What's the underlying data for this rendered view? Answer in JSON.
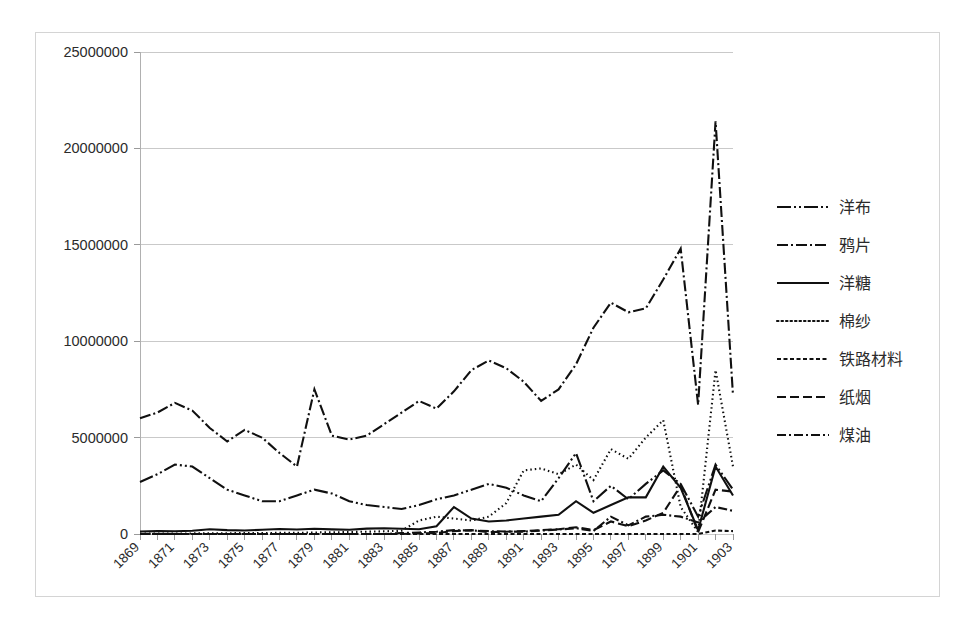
{
  "chart_data": {
    "type": "line",
    "title": "",
    "xlabel": "",
    "ylabel": "",
    "ylim": [
      0,
      25000000
    ],
    "xlim": [
      1869,
      1903
    ],
    "grid": true,
    "legend_position": "right",
    "y_ticks": [
      "0",
      "5000000",
      "10000000",
      "15000000",
      "20000000",
      "25000000"
    ],
    "y_tick_values": [
      0,
      5000000,
      10000000,
      15000000,
      20000000,
      25000000
    ],
    "x": [
      1869,
      1870,
      1871,
      1872,
      1873,
      1874,
      1875,
      1876,
      1877,
      1878,
      1879,
      1880,
      1881,
      1882,
      1883,
      1884,
      1885,
      1886,
      1887,
      1888,
      1889,
      1890,
      1891,
      1892,
      1893,
      1894,
      1895,
      1896,
      1897,
      1898,
      1899,
      1900,
      1901,
      1902,
      1903
    ],
    "x_tick_labels": [
      "1869",
      "1871",
      "1873",
      "1875",
      "1877",
      "1879",
      "1881",
      "1883",
      "1885",
      "1887",
      "1889",
      "1891",
      "1893",
      "1895",
      "1897",
      "1899",
      "1901",
      "1903"
    ],
    "x_tick_label_values": [
      1869,
      1871,
      1873,
      1875,
      1877,
      1879,
      1881,
      1883,
      1885,
      1887,
      1889,
      1891,
      1893,
      1895,
      1897,
      1899,
      1901,
      1903
    ],
    "series": [
      {
        "name": "洋布",
        "style": "longdash-dot-dot",
        "dasharray": "14,3,2,3,2,3",
        "values": [
          2700000,
          3100000,
          3600000,
          3500000,
          2900000,
          2300000,
          2000000,
          1700000,
          1700000,
          2000000,
          2300000,
          2100000,
          1700000,
          1500000,
          1400000,
          1300000,
          1500000,
          1800000,
          2000000,
          2300000,
          2600000,
          2400000,
          2000000,
          1700000,
          2900000,
          4200000,
          1700000,
          2500000,
          1800000,
          2600000,
          3300000,
          2600000,
          900000,
          3600000,
          2300000
        ]
      },
      {
        "name": "鸦片",
        "style": "dash-dot",
        "dasharray": "11,3,2,3",
        "values": [
          6000000,
          6300000,
          6800000,
          6400000,
          5500000,
          4800000,
          5400000,
          5000000,
          4200000,
          3500000,
          7500000,
          5100000,
          4900000,
          5100000,
          5700000,
          6300000,
          6900000,
          6500000,
          7400000,
          8500000,
          9000000,
          8600000,
          7900000,
          6900000,
          7500000,
          8800000,
          10700000,
          12000000,
          11500000,
          11700000,
          13200000,
          14800000,
          6700000,
          21400000,
          7200000
        ]
      },
      {
        "name": "洋糖",
        "style": "solid",
        "dasharray": "none",
        "values": [
          130000,
          150000,
          140000,
          170000,
          250000,
          200000,
          180000,
          220000,
          260000,
          230000,
          270000,
          240000,
          220000,
          280000,
          300000,
          270000,
          250000,
          400000,
          1400000,
          800000,
          650000,
          700000,
          800000,
          900000,
          1000000,
          1700000,
          1100000,
          1500000,
          1900000,
          1900000,
          3500000,
          2400000,
          200000,
          3500000,
          2000000
        ]
      },
      {
        "name": "棉纱",
        "style": "dotted",
        "dasharray": "1.5,3",
        "values": [
          20000,
          20000,
          20000,
          30000,
          30000,
          40000,
          50000,
          50000,
          60000,
          60000,
          80000,
          90000,
          100000,
          120000,
          140000,
          170000,
          700000,
          900000,
          800000,
          700000,
          900000,
          1600000,
          3300000,
          3400000,
          3100000,
          3600000,
          2800000,
          4400000,
          3900000,
          5000000,
          5900000,
          1400000,
          100000,
          8500000,
          3500000
        ]
      },
      {
        "name": "铁路材料",
        "style": "shortdash",
        "dasharray": "4,2.5",
        "values": [
          0,
          0,
          0,
          0,
          0,
          0,
          0,
          0,
          0,
          0,
          0,
          0,
          0,
          0,
          0,
          0,
          0,
          0,
          0,
          0,
          0,
          0,
          0,
          0,
          0,
          0,
          0,
          0,
          0,
          0,
          0,
          0,
          0,
          180000,
          150000
        ]
      },
      {
        "name": "纸烟",
        "style": "mediumdash",
        "dasharray": "9,4",
        "values": [
          0,
          0,
          0,
          0,
          0,
          0,
          0,
          0,
          0,
          0,
          0,
          0,
          0,
          0,
          0,
          0,
          30000,
          50000,
          150000,
          200000,
          100000,
          120000,
          150000,
          200000,
          250000,
          350000,
          200000,
          650000,
          400000,
          700000,
          1100000,
          2500000,
          100000,
          2300000,
          2200000
        ]
      },
      {
        "name": "煤油",
        "style": "dash-dot",
        "dasharray": "9,3,2,3",
        "values": [
          0,
          0,
          0,
          0,
          0,
          0,
          0,
          0,
          0,
          0,
          0,
          0,
          0,
          0,
          0,
          50000,
          80000,
          120000,
          200000,
          180000,
          150000,
          130000,
          120000,
          180000,
          230000,
          300000,
          160000,
          900000,
          450000,
          900000,
          1000000,
          900000,
          600000,
          1400000,
          1200000
        ]
      }
    ]
  },
  "legend": {
    "items": [
      {
        "label": "洋布"
      },
      {
        "label": "鸦片"
      },
      {
        "label": "洋糖"
      },
      {
        "label": "棉纱"
      },
      {
        "label": "铁路材料"
      },
      {
        "label": "纸烟"
      },
      {
        "label": "煤油"
      }
    ]
  },
  "colors": {
    "line": "#101010",
    "grid": "#c9c9c9",
    "frame": "#d4d4d4",
    "text": "#2b2b2b",
    "background": "#ffffff"
  }
}
